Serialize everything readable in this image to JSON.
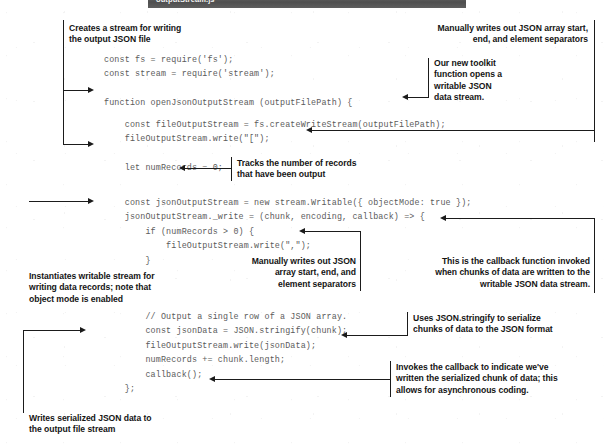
{
  "figure": {
    "header": {
      "filename": "outputStream.js"
    },
    "code_lines": {
      "group1": "const fs = require('fs');\nconst stream = require('stream');",
      "group2": "function openJsonOutputStream (outputFilePath) {",
      "group3": "    const fileOutputStream = fs.createWriteStream(outputFilePath);\n    fileOutputStream.write(\"[\");",
      "group4": "    let numRecords = 0;",
      "group5": "    const jsonOutputStream = new stream.Writable({ objectMode: true });\n    jsonOutputStream._write = (chunk, encoding, callback) => {\n        if (numRecords > 0) {\n            fileOutputStream.write(\",\");\n        }",
      "group6": "        // Output a single row of a JSON array.\n        const jsonData = JSON.stringify(chunk);\n        fileOutputStream.write(jsonData);\n        numRecords += chunk.length;\n        callback();\n    };"
    },
    "annotations": {
      "creates_stream": "Creates a stream for writing\nthe output JSON file",
      "manually_writes_top": "Manually writes out JSON array start,\nend, and element separators",
      "toolkit_function": "Our new toolkit\nfunction opens a\nwritable JSON\ndata stream.",
      "tracks_records": "Tracks the number of records\nthat have been output",
      "instantiates_stream": "Instantiates writable stream for\nwriting data records; note that\nobject mode is enabled",
      "manually_writes_mid": "Manually writes out JSON\narray start, end, and\nelement separators",
      "callback_function": "This is the callback function invoked\nwhen chunks of data are written to the\nwritable JSON data stream.",
      "uses_stringify": "Uses JSON.stringify to serialize\nchunks of data to the JSON format",
      "invokes_callback": "Invokes the callback to indicate we've\nwritten the serialized chunk of data; this\nallows for asynchronous coding.",
      "writes_serialized": "Writes serialized JSON data to\nthe output file stream"
    },
    "colors": {
      "header_bar": "#575757",
      "header_text": "#f2f2f2",
      "code_text": "#5b5b5b",
      "annotation_text": "#141414",
      "rule": "#1b1b1b",
      "page_background": "#ffffff"
    }
  }
}
